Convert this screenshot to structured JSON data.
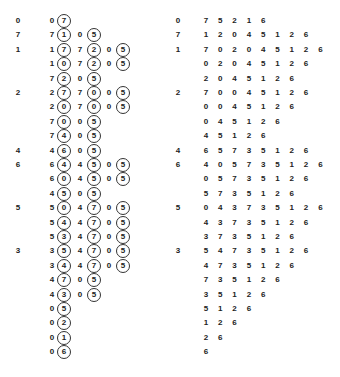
{
  "left": {
    "rows": [
      {
        "label": "0",
        "cells": [
          {
            "v": "0",
            "c": false
          },
          {
            "v": "7",
            "c": true
          }
        ]
      },
      {
        "label": "7",
        "cells": [
          {
            "v": "7",
            "c": false
          },
          {
            "v": "1",
            "c": true
          },
          {
            "v": "0",
            "c": false
          },
          {
            "v": "5",
            "c": true
          }
        ]
      },
      {
        "label": "1",
        "cells": [
          {
            "v": "1",
            "c": false
          },
          {
            "v": "7",
            "c": true
          },
          {
            "v": "7",
            "c": false
          },
          {
            "v": "2",
            "c": true
          },
          {
            "v": "0",
            "c": false
          },
          {
            "v": "5",
            "c": true
          }
        ]
      },
      {
        "label": "",
        "cells": [
          {
            "v": "1",
            "c": false
          },
          {
            "v": "0",
            "c": true
          },
          {
            "v": "7",
            "c": false
          },
          {
            "v": "2",
            "c": true
          },
          {
            "v": "0",
            "c": false
          },
          {
            "v": "5",
            "c": true
          }
        ]
      },
      {
        "label": "",
        "cells": [
          {
            "v": "7",
            "c": false
          },
          {
            "v": "2",
            "c": true
          },
          {
            "v": "0",
            "c": false
          },
          {
            "v": "5",
            "c": true
          }
        ]
      },
      {
        "label": "2",
        "cells": [
          {
            "v": "2",
            "c": false
          },
          {
            "v": "7",
            "c": true
          },
          {
            "v": "7",
            "c": false
          },
          {
            "v": "0",
            "c": true
          },
          {
            "v": "0",
            "c": false
          },
          {
            "v": "5",
            "c": true
          }
        ]
      },
      {
        "label": "",
        "cells": [
          {
            "v": "2",
            "c": false
          },
          {
            "v": "0",
            "c": true
          },
          {
            "v": "7",
            "c": false
          },
          {
            "v": "0",
            "c": true
          },
          {
            "v": "0",
            "c": false
          },
          {
            "v": "5",
            "c": true
          }
        ]
      },
      {
        "label": "",
        "cells": [
          {
            "v": "7",
            "c": false
          },
          {
            "v": "0",
            "c": true
          },
          {
            "v": "0",
            "c": false
          },
          {
            "v": "5",
            "c": true
          }
        ]
      },
      {
        "label": "",
        "cells": [
          {
            "v": "7",
            "c": false
          },
          {
            "v": "4",
            "c": true
          },
          {
            "v": "0",
            "c": false
          },
          {
            "v": "5",
            "c": true
          }
        ]
      },
      {
        "label": "4",
        "cells": [
          {
            "v": "4",
            "c": false
          },
          {
            "v": "6",
            "c": true
          },
          {
            "v": "0",
            "c": false
          },
          {
            "v": "5",
            "c": true
          }
        ]
      },
      {
        "label": "6",
        "cells": [
          {
            "v": "6",
            "c": false
          },
          {
            "v": "4",
            "c": true
          },
          {
            "v": "4",
            "c": false
          },
          {
            "v": "5",
            "c": true
          },
          {
            "v": "0",
            "c": false
          },
          {
            "v": "5",
            "c": true
          }
        ]
      },
      {
        "label": "",
        "cells": [
          {
            "v": "6",
            "c": false
          },
          {
            "v": "0",
            "c": true
          },
          {
            "v": "4",
            "c": false
          },
          {
            "v": "5",
            "c": true
          },
          {
            "v": "0",
            "c": false
          },
          {
            "v": "5",
            "c": true
          }
        ]
      },
      {
        "label": "",
        "cells": [
          {
            "v": "4",
            "c": false
          },
          {
            "v": "5",
            "c": true
          },
          {
            "v": "0",
            "c": false
          },
          {
            "v": "5",
            "c": true
          }
        ]
      },
      {
        "label": "5",
        "cells": [
          {
            "v": "5",
            "c": false
          },
          {
            "v": "0",
            "c": true
          },
          {
            "v": "4",
            "c": false
          },
          {
            "v": "7",
            "c": true
          },
          {
            "v": "0",
            "c": false
          },
          {
            "v": "5",
            "c": true
          }
        ]
      },
      {
        "label": "",
        "cells": [
          {
            "v": "5",
            "c": false
          },
          {
            "v": "4",
            "c": true
          },
          {
            "v": "4",
            "c": false
          },
          {
            "v": "7",
            "c": true
          },
          {
            "v": "0",
            "c": false
          },
          {
            "v": "5",
            "c": true
          }
        ]
      },
      {
        "label": "",
        "cells": [
          {
            "v": "5",
            "c": false
          },
          {
            "v": "3",
            "c": true
          },
          {
            "v": "4",
            "c": false
          },
          {
            "v": "7",
            "c": true
          },
          {
            "v": "0",
            "c": false
          },
          {
            "v": "5",
            "c": true
          }
        ]
      },
      {
        "label": "3",
        "cells": [
          {
            "v": "3",
            "c": false
          },
          {
            "v": "5",
            "c": true
          },
          {
            "v": "4",
            "c": false
          },
          {
            "v": "7",
            "c": true
          },
          {
            "v": "0",
            "c": false
          },
          {
            "v": "5",
            "c": true
          }
        ]
      },
      {
        "label": "",
        "cells": [
          {
            "v": "3",
            "c": false
          },
          {
            "v": "4",
            "c": true
          },
          {
            "v": "4",
            "c": false
          },
          {
            "v": "7",
            "c": true
          },
          {
            "v": "0",
            "c": false
          },
          {
            "v": "5",
            "c": true
          }
        ]
      },
      {
        "label": "",
        "cells": [
          {
            "v": "4",
            "c": false
          },
          {
            "v": "7",
            "c": true
          },
          {
            "v": "0",
            "c": false
          },
          {
            "v": "5",
            "c": true
          }
        ]
      },
      {
        "label": "",
        "cells": [
          {
            "v": "4",
            "c": false
          },
          {
            "v": "3",
            "c": true
          },
          {
            "v": "0",
            "c": false
          },
          {
            "v": "5",
            "c": true
          }
        ]
      },
      {
        "label": "",
        "cells": [
          {
            "v": "0",
            "c": false
          },
          {
            "v": "5",
            "c": true
          }
        ]
      },
      {
        "label": "",
        "cells": [
          {
            "v": "0",
            "c": false
          },
          {
            "v": "2",
            "c": true
          }
        ]
      },
      {
        "label": "",
        "cells": [
          {
            "v": "0",
            "c": false
          },
          {
            "v": "1",
            "c": true
          }
        ]
      },
      {
        "label": "",
        "cells": [
          {
            "v": "0",
            "c": false
          },
          {
            "v": "6",
            "c": true
          }
        ]
      }
    ]
  },
  "right": {
    "rows": [
      {
        "label": "0",
        "cells": [
          "7",
          "5",
          "2",
          "1",
          "6"
        ]
      },
      {
        "label": "7",
        "cells": [
          "1",
          "2",
          "0",
          "4",
          "5",
          "1",
          "2",
          "6"
        ]
      },
      {
        "label": "1",
        "cells": [
          "7",
          "0",
          "2",
          "0",
          "4",
          "5",
          "1",
          "2",
          "6"
        ]
      },
      {
        "label": "",
        "cells": [
          "0",
          "2",
          "0",
          "4",
          "5",
          "1",
          "2",
          "6"
        ]
      },
      {
        "label": "",
        "cells": [
          "2",
          "0",
          "4",
          "5",
          "1",
          "2",
          "6"
        ]
      },
      {
        "label": "2",
        "cells": [
          "7",
          "0",
          "0",
          "4",
          "5",
          "1",
          "2",
          "6"
        ]
      },
      {
        "label": "",
        "cells": [
          "0",
          "0",
          "4",
          "5",
          "1",
          "2",
          "6"
        ]
      },
      {
        "label": "",
        "cells": [
          "0",
          "4",
          "5",
          "1",
          "2",
          "6"
        ]
      },
      {
        "label": "",
        "cells": [
          "4",
          "5",
          "1",
          "2",
          "6"
        ]
      },
      {
        "label": "4",
        "cells": [
          "6",
          "5",
          "7",
          "3",
          "5",
          "1",
          "2",
          "6"
        ]
      },
      {
        "label": "6",
        "cells": [
          "4",
          "0",
          "5",
          "7",
          "3",
          "5",
          "1",
          "2",
          "6"
        ]
      },
      {
        "label": "",
        "cells": [
          "0",
          "5",
          "7",
          "3",
          "5",
          "1",
          "2",
          "6"
        ]
      },
      {
        "label": "",
        "cells": [
          "5",
          "7",
          "3",
          "5",
          "1",
          "2",
          "6"
        ]
      },
      {
        "label": "5",
        "cells": [
          "0",
          "4",
          "3",
          "7",
          "3",
          "5",
          "1",
          "2",
          "6"
        ]
      },
      {
        "label": "",
        "cells": [
          "4",
          "3",
          "7",
          "3",
          "5",
          "1",
          "2",
          "6"
        ]
      },
      {
        "label": "",
        "cells": [
          "3",
          "7",
          "3",
          "5",
          "1",
          "2",
          "6"
        ]
      },
      {
        "label": "3",
        "cells": [
          "5",
          "4",
          "7",
          "3",
          "5",
          "1",
          "2",
          "6"
        ]
      },
      {
        "label": "",
        "cells": [
          "4",
          "7",
          "3",
          "5",
          "1",
          "2",
          "6"
        ]
      },
      {
        "label": "",
        "cells": [
          "7",
          "3",
          "5",
          "1",
          "2",
          "6"
        ]
      },
      {
        "label": "",
        "cells": [
          "3",
          "5",
          "1",
          "2",
          "6"
        ]
      },
      {
        "label": "",
        "cells": [
          "5",
          "1",
          "2",
          "6"
        ]
      },
      {
        "label": "",
        "cells": [
          "1",
          "2",
          "6"
        ]
      },
      {
        "label": "",
        "cells": [
          "2",
          "6"
        ]
      },
      {
        "label": "",
        "cells": [
          "6"
        ]
      }
    ]
  }
}
